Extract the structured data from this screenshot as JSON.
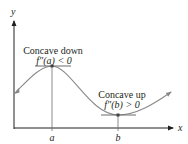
{
  "diagram": {
    "axes": {
      "x_label": "x",
      "y_label": "y"
    },
    "points": {
      "a_label": "a",
      "b_label": "b"
    },
    "annotations": {
      "max_title": "Concave down",
      "max_condition": "f″(a) < 0",
      "min_title": "Concave up",
      "min_condition": "f″(b) > 0"
    },
    "colors": {
      "curve": "#8a8a8a",
      "axis": "#231f20",
      "tangent": "#6d6d6d",
      "text": "#231f20"
    }
  }
}
